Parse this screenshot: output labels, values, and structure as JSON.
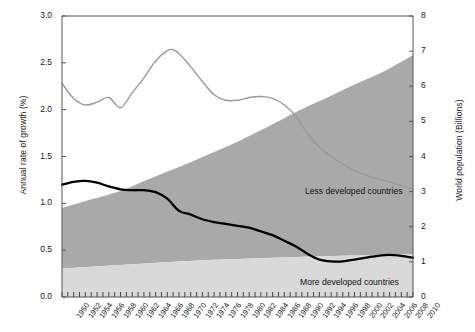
{
  "chart_data": {
    "type": "area",
    "title": "",
    "subtitle": "",
    "xlabel": "",
    "ylabel": "Annual rate of growth (%)",
    "y2label": "World population (Billions)",
    "ylim": [
      0,
      3
    ],
    "y2lim": [
      0,
      8
    ],
    "xlim": [
      1950,
      2010
    ],
    "grid": false,
    "legend_position": "inline-annotation",
    "y_ticks": [
      "0.0",
      "0.5",
      "1.0",
      "1.5",
      "2.0",
      "2.5",
      "3.0"
    ],
    "y_tick_values": [
      0.0,
      0.5,
      1.0,
      1.5,
      2.0,
      2.5,
      3.0
    ],
    "y2_ticks": [
      "0",
      "1",
      "2",
      "3",
      "4",
      "5",
      "6",
      "7",
      "8"
    ],
    "y2_tick_values": [
      0,
      1,
      2,
      3,
      4,
      5,
      6,
      7,
      8
    ],
    "x_tick_labels": [
      "1950",
      "1952",
      "1954",
      "1956",
      "1958",
      "1960",
      "1962",
      "1964",
      "1966",
      "1968",
      "1970",
      "1972",
      "1974",
      "1976",
      "1978",
      "1980",
      "1982",
      "1984",
      "1986",
      "1988",
      "1990",
      "1992",
      "1994",
      "1996",
      "1998",
      "2000",
      "2002",
      "2004",
      "2006",
      "2008",
      "2010"
    ],
    "x_tick_values": [
      1950,
      1952,
      1954,
      1956,
      1958,
      1960,
      1962,
      1964,
      1966,
      1968,
      1970,
      1972,
      1974,
      1976,
      1978,
      1980,
      1982,
      1984,
      1986,
      1988,
      1990,
      1992,
      1994,
      1996,
      1998,
      2000,
      2002,
      2004,
      2006,
      2008,
      2010
    ],
    "annotations": [
      {
        "text": "Less developed countries",
        "x": 1992,
        "y2": 3.4
      },
      {
        "text": "More developed countries",
        "x": 1991,
        "y2": 0.42
      }
    ],
    "colors": {
      "less_developed_area": "#a9a9a9",
      "more_developed_area": "#d9d9d9",
      "world_growth_line": "#9a9a9a",
      "more_developed_growth_line": "#000000",
      "axis": "#555555",
      "text": "#1a1a1a",
      "background": "#ffffff"
    },
    "series": [
      {
        "name": "More developed countries",
        "kind": "area",
        "axis": "right",
        "unit": "Billions",
        "x": [
          1950,
          1955,
          1960,
          1965,
          1970,
          1975,
          1980,
          1985,
          1990,
          1995,
          2000,
          2005,
          2010
        ],
        "values": [
          0.81,
          0.86,
          0.91,
          0.96,
          1.01,
          1.05,
          1.08,
          1.11,
          1.14,
          1.16,
          1.18,
          1.2,
          1.22
        ]
      },
      {
        "name": "Less developed countries",
        "kind": "area",
        "axis": "right",
        "unit": "Billions",
        "stacked_on": "More developed countries",
        "x": [
          1950,
          1955,
          1960,
          1965,
          1970,
          1975,
          1980,
          1985,
          1990,
          1995,
          2000,
          2005,
          2010
        ],
        "values": [
          1.72,
          1.92,
          2.11,
          2.41,
          2.69,
          3.01,
          3.34,
          3.72,
          4.13,
          4.49,
          4.87,
          5.22,
          5.66
        ]
      },
      {
        "name": "World total population",
        "kind": "area-top",
        "axis": "right",
        "unit": "Billions",
        "x": [
          1950,
          1955,
          1960,
          1965,
          1970,
          1975,
          1980,
          1985,
          1990,
          1995,
          2000,
          2005,
          2010
        ],
        "values": [
          2.53,
          2.78,
          3.02,
          3.37,
          3.7,
          4.06,
          4.42,
          4.83,
          5.27,
          5.65,
          6.05,
          6.42,
          6.88
        ]
      },
      {
        "name": "World annual rate of growth",
        "kind": "line",
        "axis": "left",
        "unit": "%",
        "x": [
          1950,
          1952,
          1954,
          1956,
          1958,
          1960,
          1962,
          1964,
          1966,
          1968,
          1969,
          1970,
          1972,
          1974,
          1976,
          1978,
          1980,
          1982,
          1984,
          1986,
          1988,
          1990,
          1992,
          1994,
          1996,
          1998,
          2000,
          2002,
          2004,
          2006,
          2008,
          2010
        ],
        "values": [
          2.28,
          2.12,
          2.05,
          2.08,
          2.13,
          2.02,
          2.18,
          2.34,
          2.52,
          2.63,
          2.64,
          2.6,
          2.46,
          2.3,
          2.16,
          2.1,
          2.1,
          2.13,
          2.14,
          2.12,
          2.05,
          1.93,
          1.74,
          1.6,
          1.5,
          1.42,
          1.35,
          1.3,
          1.26,
          1.23,
          1.19,
          1.15
        ]
      },
      {
        "name": "More developed countries annual rate of growth",
        "kind": "line",
        "axis": "left",
        "unit": "%",
        "x": [
          1950,
          1952,
          1954,
          1956,
          1958,
          1960,
          1962,
          1964,
          1966,
          1968,
          1970,
          1972,
          1974,
          1976,
          1978,
          1980,
          1982,
          1984,
          1986,
          1988,
          1990,
          1992,
          1994,
          1996,
          1998,
          2000,
          2002,
          2004,
          2006,
          2008,
          2010
        ],
        "values": [
          1.2,
          1.23,
          1.24,
          1.22,
          1.18,
          1.15,
          1.14,
          1.14,
          1.12,
          1.05,
          0.92,
          0.88,
          0.83,
          0.8,
          0.78,
          0.76,
          0.74,
          0.7,
          0.66,
          0.6,
          0.54,
          0.46,
          0.4,
          0.38,
          0.38,
          0.4,
          0.42,
          0.44,
          0.45,
          0.44,
          0.42
        ]
      }
    ]
  },
  "plot": {
    "left_axis_title": "Annual rate of growth (%)",
    "right_axis_title": "World population (Billions)",
    "less_developed_label": "Less developed countries",
    "more_developed_label": "More developed countries"
  }
}
